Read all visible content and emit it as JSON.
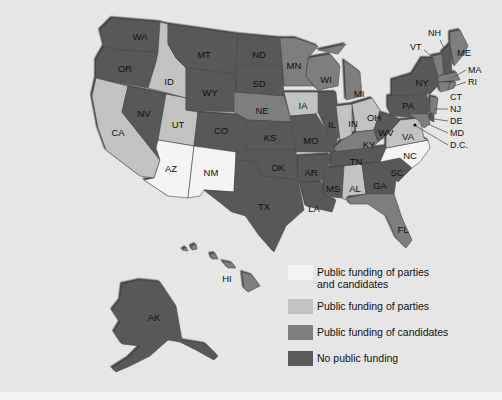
{
  "map": {
    "title": "",
    "colors": {
      "parties_and_candidates": "#f4f4f4",
      "parties": "#c2c2c2",
      "candidates": "#7e7e7e",
      "none": "#595959",
      "background": "#e6e6e6"
    },
    "states": {
      "WA": {
        "label": "WA",
        "category": "none"
      },
      "OR": {
        "label": "OR",
        "category": "none"
      },
      "CA": {
        "label": "CA",
        "category": "parties"
      },
      "ID": {
        "label": "ID",
        "category": "parties"
      },
      "NV": {
        "label": "NV",
        "category": "none"
      },
      "UT": {
        "label": "UT",
        "category": "parties"
      },
      "AZ": {
        "label": "AZ",
        "category": "parties_and_candidates"
      },
      "MT": {
        "label": "MT",
        "category": "none"
      },
      "WY": {
        "label": "WY",
        "category": "none"
      },
      "CO": {
        "label": "CO",
        "category": "none"
      },
      "NM": {
        "label": "NM",
        "category": "parties_and_candidates"
      },
      "ND": {
        "label": "ND",
        "category": "none"
      },
      "SD": {
        "label": "SD",
        "category": "none"
      },
      "NE": {
        "label": "NE",
        "category": "candidates"
      },
      "KS": {
        "label": "KS",
        "category": "none"
      },
      "OK": {
        "label": "OK",
        "category": "none"
      },
      "TX": {
        "label": "TX",
        "category": "none"
      },
      "MN": {
        "label": "MN",
        "category": "candidates"
      },
      "IA": {
        "label": "IA",
        "category": "parties"
      },
      "MO": {
        "label": "MO",
        "category": "none"
      },
      "AR": {
        "label": "AR",
        "category": "none"
      },
      "LA": {
        "label": "LA",
        "category": "none"
      },
      "WI": {
        "label": "WI",
        "category": "candidates"
      },
      "IL": {
        "label": "IL",
        "category": "none"
      },
      "MI": {
        "label": "MI",
        "category": "candidates"
      },
      "IN": {
        "label": "IN",
        "category": "parties"
      },
      "OH": {
        "label": "OH",
        "category": "parties"
      },
      "KY": {
        "label": "KY",
        "category": "candidates"
      },
      "TN": {
        "label": "TN",
        "category": "none"
      },
      "MS": {
        "label": "MS",
        "category": "none"
      },
      "AL": {
        "label": "AL",
        "category": "parties"
      },
      "GA": {
        "label": "GA",
        "category": "none"
      },
      "FL": {
        "label": "FL",
        "category": "candidates"
      },
      "SC": {
        "label": "SC",
        "category": "none"
      },
      "NC": {
        "label": "NC",
        "category": "parties_and_candidates"
      },
      "VA": {
        "label": "VA",
        "category": "parties"
      },
      "WV": {
        "label": "WV",
        "category": "none"
      },
      "PA": {
        "label": "PA",
        "category": "none"
      },
      "NY": {
        "label": "NY",
        "category": "none"
      },
      "VT": {
        "label": "VT",
        "category": "candidates"
      },
      "NH": {
        "label": "NH",
        "category": "none"
      },
      "ME": {
        "label": "ME",
        "category": "candidates"
      },
      "MA": {
        "label": "MA",
        "category": "candidates"
      },
      "RI": {
        "label": "RI",
        "category": "candidates"
      },
      "CT": {
        "label": "CT",
        "category": "candidates"
      },
      "NJ": {
        "label": "NJ",
        "category": "candidates"
      },
      "DE": {
        "label": "DE",
        "category": "none"
      },
      "MD": {
        "label": "MD",
        "category": "candidates"
      },
      "DC": {
        "label": "D.C.",
        "category": "none"
      },
      "HI": {
        "label": "HI",
        "category": "candidates"
      },
      "AK": {
        "label": "AK",
        "category": "none"
      }
    }
  },
  "legend": {
    "items": [
      {
        "label": "Public funding of parties and candidates",
        "line1": "Public funding of parties",
        "line2": "and candidates",
        "color": "#f4f4f4"
      },
      {
        "label": "Public funding of parties",
        "color": "#c2c2c2"
      },
      {
        "label": "Public funding of candidates",
        "color": "#7e7e7e"
      },
      {
        "label": "No public funding",
        "color": "#595959"
      }
    ]
  }
}
